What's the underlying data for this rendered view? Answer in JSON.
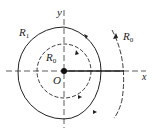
{
  "diagram": {
    "type": "phase-plane trajectories",
    "axes": {
      "x_label": "x",
      "y_label": "y",
      "origin_label": "O"
    },
    "curves": [
      {
        "name": "inner-closed-orbit",
        "label": "R",
        "label_sub": "0",
        "style": "dashed",
        "direction": "clockwise"
      },
      {
        "name": "outer-spiral",
        "label": "R",
        "label_sub": "1",
        "style": "solid",
        "direction": "clockwise"
      },
      {
        "name": "right-arc",
        "label": "R",
        "label_sub": "0",
        "style": "dashed",
        "direction": "upward"
      }
    ],
    "colors": {
      "stroke": "#222222",
      "background": "#ffffff"
    }
  }
}
